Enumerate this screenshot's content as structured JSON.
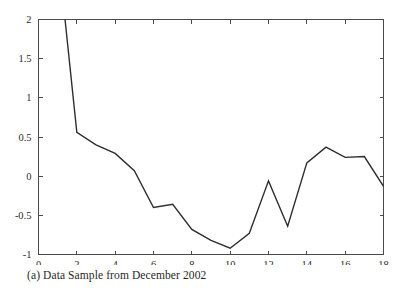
{
  "figure": {
    "caption": "(a) Data Sample from December 2002",
    "background_color": "#ffffff",
    "line_color": "#2e2e2e",
    "axis_color": "#4a4a4a"
  },
  "chart_data": {
    "type": "line",
    "title": "",
    "subtitle": "",
    "xlabel": "",
    "ylabel": "",
    "xlim": [
      0,
      18
    ],
    "ylim": [
      -1,
      2
    ],
    "xticks": [
      0,
      2,
      4,
      6,
      8,
      10,
      12,
      14,
      16,
      18
    ],
    "xtick_labels": [
      "0",
      "2",
      "4",
      "6",
      "8",
      "10",
      "12",
      "14",
      "16",
      "18"
    ],
    "yticks": [
      -1,
      -0.5,
      0,
      0.5,
      1,
      1.5,
      2
    ],
    "ytick_labels": [
      "-1",
      "-0.5",
      "0",
      "0.5",
      "1",
      "1.5",
      "2"
    ],
    "grid": false,
    "legend": null,
    "legend_position": "none",
    "annotations": [],
    "note": "Series begins off the top of the axis at x=1 and is clipped by the y=2 upper limit.",
    "x": [
      1,
      2,
      3,
      4,
      5,
      6,
      7,
      8,
      9,
      10,
      11,
      12,
      13,
      14,
      15,
      16,
      17,
      18
    ],
    "series": [
      {
        "name": "Data Sample",
        "values": [
          2.9,
          0.56,
          0.4,
          0.29,
          0.07,
          -0.4,
          -0.36,
          -0.68,
          -0.82,
          -0.92,
          -0.73,
          -0.06,
          -0.64,
          0.17,
          0.37,
          0.24,
          0.25,
          -0.13
        ]
      }
    ]
  }
}
